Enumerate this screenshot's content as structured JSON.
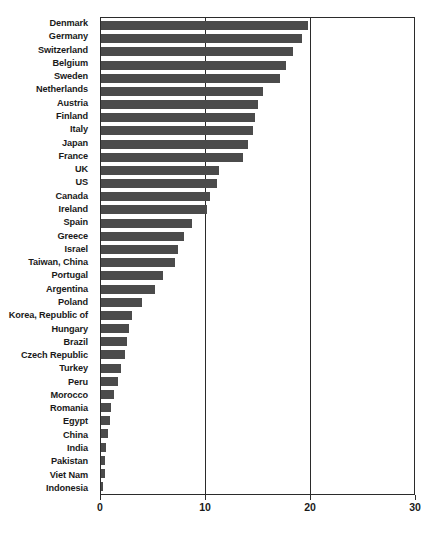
{
  "chart_data": {
    "type": "bar",
    "orientation": "horizontal",
    "title": "",
    "subtitle": "",
    "xlabel": "",
    "ylabel": "",
    "xlim": [
      0,
      30
    ],
    "ylim": null,
    "grid": true,
    "gridlines_x": [
      10,
      20
    ],
    "legend": null,
    "legend_position": "none",
    "xticks": [
      "0",
      "10",
      "20",
      "30"
    ],
    "xtick_values": [
      0,
      10,
      20,
      30
    ],
    "bar_color": "#4b4b4b",
    "axis_color": "#2b2b2b",
    "background_color": "#ffffff",
    "categories": [
      "Denmark",
      "Germany",
      "Switzerland",
      "Belgium",
      "Sweden",
      "Netherlands",
      "Austria",
      "Finland",
      "Italy",
      "Japan",
      "France",
      "UK",
      "US",
      "Canada",
      "Ireland",
      "Spain",
      "Greece",
      "Israel",
      "Taiwan, China",
      "Portugal",
      "Argentina",
      "Poland",
      "Korea, Republic of",
      "Hungary",
      "Brazil",
      "Czech Republic",
      "Turkey",
      "Peru",
      "Morocco",
      "Romania",
      "Egypt",
      "China",
      "India",
      "Pakistan",
      "Viet Nam",
      "Indonesia"
    ],
    "values": [
      19.8,
      19.3,
      18.4,
      17.7,
      17.2,
      15.5,
      15.0,
      14.8,
      14.6,
      14.1,
      13.6,
      11.3,
      11.1,
      10.4,
      10.2,
      8.7,
      8.0,
      7.4,
      7.1,
      5.9,
      5.2,
      3.9,
      3.0,
      2.7,
      2.5,
      2.3,
      1.9,
      1.6,
      1.2,
      1.0,
      0.9,
      0.7,
      0.5,
      0.4,
      0.35,
      0.2
    ]
  }
}
